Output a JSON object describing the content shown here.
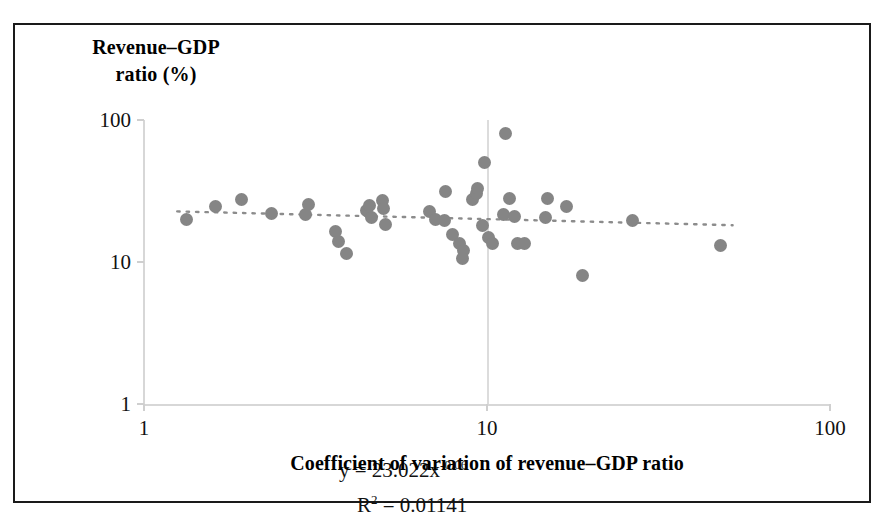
{
  "figure": {
    "frame_color": "#1a1a1a",
    "background": "#ffffff"
  },
  "axis_titles": {
    "y_line1": "Revenue–GDP",
    "y_line2": "ratio (%)",
    "x": "Coefficient of variation of revenue–GDP ratio"
  },
  "annotation": {
    "equation_prefix": "y = 23.022x",
    "equation_exponent": "-0.06",
    "r_squared_prefix": "R",
    "r_squared_sup": "2",
    "r_squared_value": " = 0.01141",
    "equation_full": "y = 23.022x-0.06",
    "r_squared_full": "R² = 0.01141"
  },
  "chart_data": {
    "type": "scatter",
    "title": "",
    "subtitle": "",
    "xlabel": "Coefficient of variation of revenue–GDP ratio",
    "ylabel": "Revenue–GDP ratio (%)",
    "xscale": "log",
    "yscale": "log",
    "xlim": [
      1,
      100
    ],
    "ylim": [
      1,
      100
    ],
    "xticks": [
      1,
      10,
      100
    ],
    "xtick_labels": [
      "1",
      "10",
      "100"
    ],
    "yticks": [
      1,
      10,
      100
    ],
    "ytick_labels": [
      "1",
      "10",
      "100"
    ],
    "grid": "vertical gridline at x=10 only",
    "legend": "none",
    "marker_color": "#858585",
    "marker_shape": "circle",
    "trendline": {
      "style": "dotted",
      "color": "#8c8c8c",
      "equation": "y = 23.022x^-0.06",
      "r_squared": 0.01141,
      "coefficient": 23.022,
      "exponent": -0.06
    },
    "points": [
      {
        "x": 1.33,
        "y": 20.0
      },
      {
        "x": 1.62,
        "y": 24.5
      },
      {
        "x": 1.92,
        "y": 27.5
      },
      {
        "x": 2.35,
        "y": 22.0
      },
      {
        "x": 2.95,
        "y": 21.5
      },
      {
        "x": 3.02,
        "y": 25.5
      },
      {
        "x": 3.62,
        "y": 16.5
      },
      {
        "x": 3.7,
        "y": 14.0
      },
      {
        "x": 3.9,
        "y": 11.5
      },
      {
        "x": 4.45,
        "y": 23.0
      },
      {
        "x": 4.55,
        "y": 25.0
      },
      {
        "x": 4.6,
        "y": 20.5
      },
      {
        "x": 4.95,
        "y": 27.0
      },
      {
        "x": 5.05,
        "y": 18.5
      },
      {
        "x": 5.0,
        "y": 24.0
      },
      {
        "x": 6.8,
        "y": 22.5
      },
      {
        "x": 7.1,
        "y": 20.0
      },
      {
        "x": 7.55,
        "y": 31.5
      },
      {
        "x": 7.5,
        "y": 19.5
      },
      {
        "x": 7.95,
        "y": 15.5
      },
      {
        "x": 8.3,
        "y": 13.5
      },
      {
        "x": 8.55,
        "y": 12.0
      },
      {
        "x": 8.5,
        "y": 10.5
      },
      {
        "x": 9.1,
        "y": 27.5
      },
      {
        "x": 9.35,
        "y": 30.5
      },
      {
        "x": 9.4,
        "y": 33.0
      },
      {
        "x": 9.7,
        "y": 18.0
      },
      {
        "x": 9.85,
        "y": 50.0
      },
      {
        "x": 10.1,
        "y": 15.0
      },
      {
        "x": 10.4,
        "y": 13.5
      },
      {
        "x": 11.3,
        "y": 80.0
      },
      {
        "x": 11.2,
        "y": 21.5
      },
      {
        "x": 11.6,
        "y": 28.0
      },
      {
        "x": 12.0,
        "y": 21.0
      },
      {
        "x": 12.3,
        "y": 13.5
      },
      {
        "x": 12.9,
        "y": 13.5
      },
      {
        "x": 15.0,
        "y": 28.0
      },
      {
        "x": 14.8,
        "y": 20.5
      },
      {
        "x": 17.0,
        "y": 24.5
      },
      {
        "x": 19.0,
        "y": 8.0
      },
      {
        "x": 26.5,
        "y": 19.5
      },
      {
        "x": 48.0,
        "y": 13.0
      }
    ]
  }
}
